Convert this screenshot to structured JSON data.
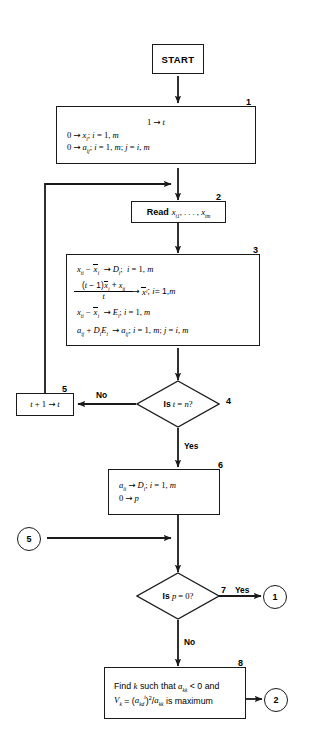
{
  "figure": {
    "type": "flowchart",
    "title": "",
    "background_color": "#ffffff",
    "stroke_color": "#1a1a1a"
  },
  "nodes": {
    "start": {
      "id": "start",
      "shape": "terminal",
      "label": "START"
    },
    "box1": {
      "id": "1",
      "shape": "process",
      "step": "1",
      "lines": [
        "1 → t",
        "0 → xᵢ; i = 1, m",
        "0 → aᵢⱼ; i = 1, m; j = i, m"
      ]
    },
    "box2": {
      "id": "2",
      "shape": "process",
      "step": "2",
      "keyword": "Read",
      "lines": [
        "Read xₜ₁, . . . , xₜₘ"
      ]
    },
    "box3": {
      "id": "3",
      "shape": "process",
      "step": "3",
      "lines": [
        "xₜᵢ − x̄ᵢ → Dᵢ;  i = 1, m",
        "[(t − 1)x̄ᵢ + xₜᵢ] / t → x̄ᵢ; i = 1, m",
        "xₜᵢ − x̄ᵢ → Eᵢ; i = 1, m",
        "aᵢⱼ + DᵢEᵢ → aᵢⱼ; i = 1, m; j = i, m"
      ],
      "fraction": {
        "numerator": "(t − 1)x̄ᵢ + xₜᵢ",
        "denominator": "t"
      }
    },
    "box4": {
      "id": "4",
      "shape": "decision",
      "step": "4",
      "label": "Is t = n?",
      "yes_label": "Yes",
      "no_label": "No"
    },
    "box5": {
      "id": "5",
      "shape": "process",
      "step": "5",
      "lines": [
        "t + 1 → t"
      ]
    },
    "box6": {
      "id": "6",
      "shape": "process",
      "step": "6",
      "lines": [
        "aᵢᵢ → Dᵢ; i = 1, m",
        "0 → p"
      ]
    },
    "box7": {
      "id": "7",
      "shape": "decision",
      "step": "7",
      "label": "Is p = 0?",
      "yes_label": "Yes",
      "no_label": "No"
    },
    "box8": {
      "id": "8",
      "shape": "process",
      "step": "8",
      "lines": [
        "Find k such that aₖₖ < 0 and",
        "Vₖ = (aₖₔᵗ)²/aₖₖ is maximum"
      ]
    }
  },
  "connectors": {
    "in_5": {
      "label": "5",
      "role": "entry-connector"
    },
    "out_1": {
      "label": "1",
      "role": "exit-connector"
    },
    "out_2": {
      "label": "2",
      "role": "exit-connector"
    }
  },
  "edge_labels": {
    "no_t_eq_n": "No",
    "yes_t_eq_n": "Yes",
    "yes_p_eq_0": "Yes",
    "no_p_eq_0": "No"
  },
  "step_numbers": [
    "1",
    "2",
    "3",
    "4",
    "5",
    "6",
    "7",
    "8"
  ]
}
